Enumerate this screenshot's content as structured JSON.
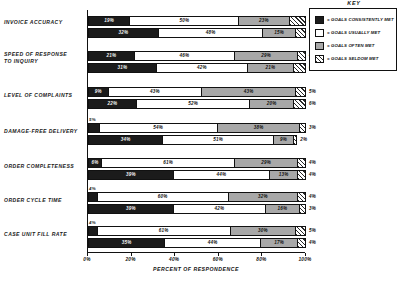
{
  "chart_data": {
    "type": "bar",
    "orientation": "horizontal",
    "stacked": true,
    "title": "",
    "xlabel": "PERCENT OF RESPONDENCE",
    "ylabel": "",
    "xlim": [
      0,
      100
    ],
    "xticks": [
      "0%",
      "20%",
      "40%",
      "60%",
      "80%",
      "100%"
    ],
    "grid": false,
    "legend_position": "right",
    "legend_title": "KEY",
    "series": [
      {
        "name": "= GOALS CONSISTENTLY MET",
        "key": "consistent"
      },
      {
        "name": "= GOALS USUALLY MET",
        "key": "usually"
      },
      {
        "name": "= GOALS OFTEN MET",
        "key": "often"
      },
      {
        "name": "= GOALS SELDOM MET",
        "key": "seldom"
      }
    ],
    "categories": [
      "INVOICE ACCURACY",
      "SPEED OF RESPONSE TO INQUIRY",
      "LEVEL OF COMPLAINTS",
      "DAMAGE-FREE DELIVERY",
      "ORDER COMPLETENESS",
      "ORDER CYCLE TIME",
      "CASE UNIT FILL RATE"
    ],
    "groups": [
      {
        "category": "INVOICE ACCURACY",
        "bars": [
          {
            "values": [
              19,
              50,
              23,
              8
            ],
            "labels": [
              "19%",
              "50%",
              "23%",
              "8%"
            ]
          },
          {
            "values": [
              32,
              48,
              15,
              5
            ],
            "labels": [
              "32%",
              "48%",
              "15%",
              "5%"
            ]
          }
        ]
      },
      {
        "category": "SPEED OF RESPONSE TO INQUIRY",
        "bars": [
          {
            "values": [
              21,
              46,
              29,
              4
            ],
            "labels": [
              "21%",
              "46%",
              "29%",
              "4%"
            ]
          },
          {
            "values": [
              31,
              42,
              21,
              6
            ],
            "labels": [
              "31%",
              "42%",
              "21%",
              "6%"
            ]
          }
        ]
      },
      {
        "category": "LEVEL OF COMPLAINTS",
        "bars": [
          {
            "values": [
              9,
              43,
              43,
              5
            ],
            "labels": [
              "9%",
              "43%",
              "43%",
              "5%"
            ]
          },
          {
            "values": [
              22,
              52,
              20,
              6
            ],
            "labels": [
              "22%",
              "52%",
              "20%",
              "6%"
            ]
          }
        ]
      },
      {
        "category": "DAMAGE-FREE DELIVERY",
        "bars": [
          {
            "values": [
              5,
              54,
              38,
              3
            ],
            "labels": [
              "5%",
              "54%",
              "38%",
              "3%"
            ]
          },
          {
            "values": [
              34,
              51,
              9,
              2
            ],
            "labels": [
              "34%",
              "51%",
              "9%",
              "2%"
            ]
          }
        ]
      },
      {
        "category": "ORDER COMPLETENESS",
        "bars": [
          {
            "values": [
              6,
              61,
              29,
              4
            ],
            "labels": [
              "6%",
              "61%",
              "29%",
              "4%"
            ]
          },
          {
            "values": [
              39,
              44,
              13,
              4
            ],
            "labels": [
              "39%",
              "44%",
              "13%",
              "4%"
            ]
          }
        ]
      },
      {
        "category": "ORDER CYCLE TIME",
        "bars": [
          {
            "values": [
              4,
              60,
              32,
              4
            ],
            "labels": [
              "4%",
              "60%",
              "32%",
              "4%"
            ]
          },
          {
            "values": [
              39,
              42,
              16,
              3
            ],
            "labels": [
              "39%",
              "42%",
              "16%",
              "3%"
            ]
          }
        ]
      },
      {
        "category": "CASE UNIT FILL RATE",
        "bars": [
          {
            "values": [
              4,
              61,
              30,
              5
            ],
            "labels": [
              "4%",
              "61%",
              "30%",
              "5%"
            ]
          },
          {
            "values": [
              35,
              44,
              17,
              4
            ],
            "labels": [
              "35%",
              "44%",
              "17%",
              "4%"
            ]
          }
        ]
      }
    ]
  },
  "colors": {
    "consistent": "#1b1b1b",
    "usually": "#ffffff",
    "often": "#a8a8a8",
    "seldom": "#ffffff",
    "axis": "#111111",
    "background": "#ffffff"
  }
}
